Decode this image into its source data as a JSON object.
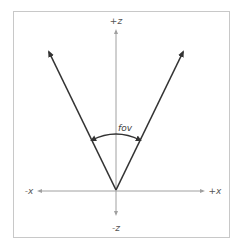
{
  "diagram": {
    "title": "",
    "axes": {
      "pos_z": "+z",
      "neg_z": "-z",
      "pos_x": "+x",
      "neg_x": "-x"
    },
    "angle_label": "fov",
    "colors": {
      "frame": "#c8c8c8",
      "axis": "#a0a0a0",
      "ray": "#333333",
      "arc": "#333333",
      "label": "#555555"
    }
  }
}
